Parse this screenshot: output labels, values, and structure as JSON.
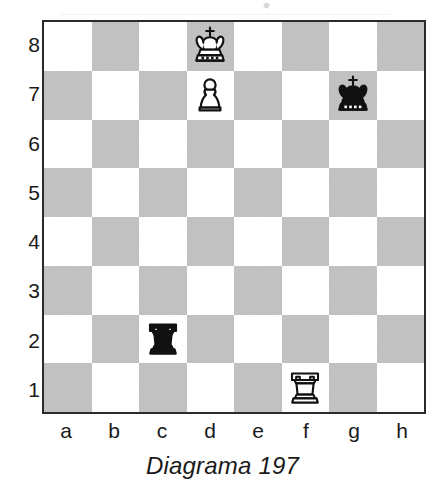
{
  "figure": {
    "caption": "Diagrama 197"
  },
  "board": {
    "light_square_color": "#ffffff",
    "dark_square_color": "#bdbdbd",
    "border_color": "#2b2b2b",
    "orientation": "white-bottom",
    "file_labels": [
      "a",
      "b",
      "c",
      "d",
      "e",
      "f",
      "g",
      "h"
    ],
    "rank_labels": [
      "8",
      "7",
      "6",
      "5",
      "4",
      "3",
      "2",
      "1"
    ]
  },
  "chart_data": {
    "type": "table",
    "title": "Diagrama 197",
    "subtitle": "",
    "xlabel": "",
    "ylabel": "",
    "diagram_kind": "chessboard",
    "files": [
      "a",
      "b",
      "c",
      "d",
      "e",
      "f",
      "g",
      "h"
    ],
    "ranks": [
      "8",
      "7",
      "6",
      "5",
      "4",
      "3",
      "2",
      "1"
    ],
    "fen": "3K4/3P2k1/8/8/8/8/2r5/5R2 w - - 0 1",
    "pieces": [
      {
        "square": "d8",
        "color": "white",
        "type": "king",
        "glyph": "white-king-icon",
        "file": "d",
        "rank": "8"
      },
      {
        "square": "d7",
        "color": "white",
        "type": "pawn",
        "glyph": "white-pawn-icon",
        "file": "d",
        "rank": "7"
      },
      {
        "square": "g7",
        "color": "black",
        "type": "king",
        "glyph": "black-king-icon",
        "file": "g",
        "rank": "7"
      },
      {
        "square": "c2",
        "color": "black",
        "type": "rook",
        "glyph": "black-rook-icon",
        "file": "c",
        "rank": "2"
      },
      {
        "square": "f1",
        "color": "white",
        "type": "rook",
        "glyph": "white-rook-icon",
        "file": "f",
        "rank": "1"
      }
    ],
    "piece_counts": {
      "white": 3,
      "black": 2,
      "total": 5
    },
    "legend": [],
    "grid": true
  }
}
